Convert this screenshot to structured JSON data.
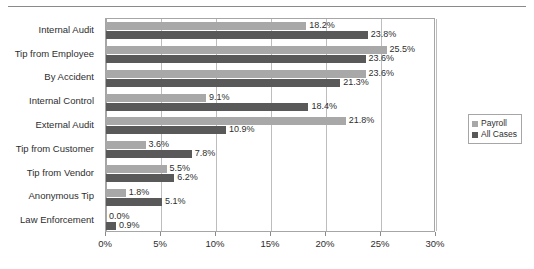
{
  "chart_data": {
    "type": "bar",
    "orientation": "horizontal",
    "title": "",
    "xlabel": "",
    "ylabel": "",
    "xlim": [
      0,
      30
    ],
    "grid": true,
    "legend_position": "right",
    "categories": [
      "Internal Audit",
      "Tip from Employee",
      "By Accident",
      "Internal Control",
      "External Audit",
      "Tip from Customer",
      "Tip from Vendor",
      "Anonymous Tip",
      "Law Enforcement"
    ],
    "series": [
      {
        "name": "Payroll",
        "color": "#a8a8a8",
        "values": [
          18.2,
          25.5,
          23.6,
          9.1,
          21.8,
          3.6,
          5.5,
          1.8,
          0.0
        ],
        "labels": [
          "18.2%",
          "25.5%",
          "23.6%",
          "9.1%",
          "21.8%",
          "3.6%",
          "5.5%",
          "1.8%",
          "0.0%"
        ]
      },
      {
        "name": "All Cases",
        "color": "#595959",
        "values": [
          23.8,
          23.6,
          21.3,
          18.4,
          10.9,
          7.8,
          6.2,
          5.1,
          0.9
        ],
        "labels": [
          "23.8%",
          "23.6%",
          "21.3%",
          "18.4%",
          "10.9%",
          "7.8%",
          "6.2%",
          "5.1%",
          "0.9%"
        ]
      }
    ],
    "xticks": [
      0,
      5,
      10,
      15,
      20,
      25,
      30
    ],
    "xtick_labels": [
      "0%",
      "5%",
      "10%",
      "15%",
      "20%",
      "25%",
      "30%"
    ]
  },
  "legend": {
    "items": [
      {
        "label": "Payroll",
        "color": "#a8a8a8"
      },
      {
        "label": "All Cases",
        "color": "#595959"
      }
    ]
  }
}
